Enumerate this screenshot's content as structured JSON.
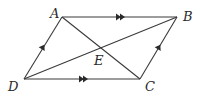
{
  "diagram": {
    "type": "geometry",
    "shape": "parallelogram",
    "points": {
      "A": {
        "label": "A",
        "x": 62,
        "y": 17
      },
      "B": {
        "label": "B",
        "x": 177,
        "y": 17
      },
      "C": {
        "label": "C",
        "x": 140,
        "y": 79
      },
      "D": {
        "label": "D",
        "x": 24,
        "y": 79
      },
      "E": {
        "label": "E",
        "x": 101,
        "y": 48
      }
    },
    "edges": [
      {
        "from": "A",
        "to": "B",
        "marker": "double-arrow"
      },
      {
        "from": "D",
        "to": "C",
        "marker": "double-arrow"
      },
      {
        "from": "D",
        "to": "A",
        "marker": "single-arrow"
      },
      {
        "from": "C",
        "to": "B",
        "marker": "single-arrow"
      },
      {
        "from": "A",
        "to": "C",
        "marker": "none"
      },
      {
        "from": "D",
        "to": "B",
        "marker": "none"
      }
    ],
    "colors": {
      "stroke": "#3a3a3a",
      "text": "#2a2a2a",
      "background": "#ffffff"
    }
  }
}
